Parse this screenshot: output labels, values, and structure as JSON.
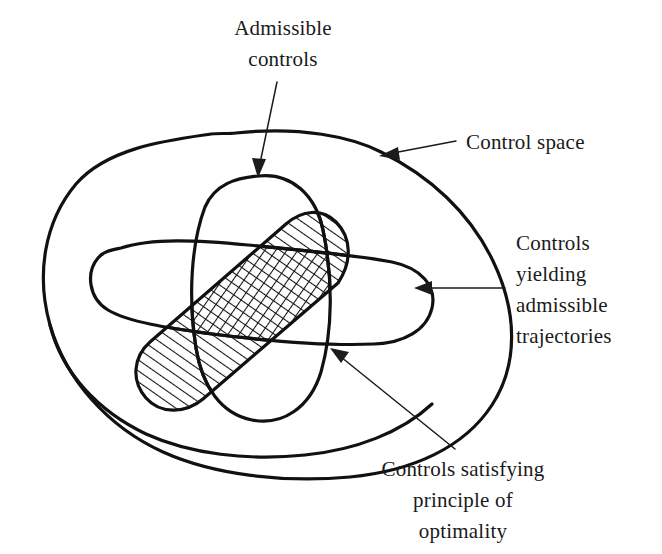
{
  "figure": {
    "background_color": "#ffffff",
    "ink_color": "#111111",
    "width": 662,
    "height": 554
  },
  "labels": {
    "admissible_controls": {
      "line1": "Admissible",
      "line2": "controls",
      "target": "admissible-controls-region"
    },
    "control_space": {
      "line1": "Control space",
      "target": "control-space-region"
    },
    "yielding_admissible_trajectories": {
      "line1": "Controls",
      "line2": "yielding",
      "line3": "admissible",
      "line4": "trajectories",
      "target": "admissible-trajectories-region"
    },
    "principle_of_optimality": {
      "line1": "Controls satisfying",
      "line2": "principle of",
      "line3": "optimality",
      "target": "optimality-region"
    }
  },
  "regions": [
    {
      "name": "control-space-region",
      "label": "Control space",
      "fill": "none",
      "shading": "none"
    },
    {
      "name": "admissible-controls-region",
      "label": "Admissible controls",
      "fill": "none",
      "shading": "none"
    },
    {
      "name": "admissible-trajectories-region",
      "label": "Controls yielding admissible trajectories",
      "fill": "none",
      "shading": "none"
    },
    {
      "name": "optimality-region",
      "label": "Controls satisfying principle of optimality",
      "fill": "none",
      "shading": "diagonal-hatch"
    },
    {
      "name": "triple-intersection-region",
      "label": "Intersection of all three control subsets",
      "fill": "none",
      "shading": "cross-hatch"
    }
  ]
}
